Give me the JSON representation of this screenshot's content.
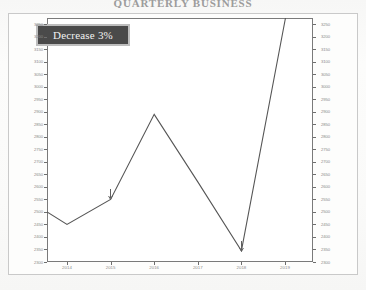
{
  "title": "QUARTERLY BUSINESS",
  "callout": {
    "label": "Decrease 3%",
    "box_color": "#4a4a4a",
    "border_color": "#bdbdbd",
    "text_color": "#f2f2f2"
  },
  "axis": {
    "y_left_ticks": [
      "3250",
      "3200",
      "3150",
      "3100",
      "3050",
      "3000",
      "2950",
      "2900",
      "2850",
      "2800",
      "2750",
      "2700",
      "2650",
      "2600",
      "2550",
      "2500",
      "2450",
      "2400",
      "2350",
      "2300"
    ],
    "y_right_ticks": [
      "3250",
      "3200",
      "3150",
      "3100",
      "3050",
      "3000",
      "2950",
      "2900",
      "2850",
      "2800",
      "2750",
      "2700",
      "2650",
      "2600",
      "2550",
      "2500",
      "2450",
      "2400",
      "2350",
      "2300"
    ],
    "x_ticks": [
      "2014",
      "2015",
      "2016",
      "2017",
      "2018",
      "2019"
    ]
  },
  "annotations": [
    {
      "name": "arrow-2015",
      "symbol": "down-arrow"
    },
    {
      "name": "arrow-2018",
      "symbol": "down-arrow"
    }
  ],
  "chart_data": {
    "type": "line",
    "title": "QUARTERLY BUSINESS",
    "xlabel": "",
    "ylabel": "",
    "categories": [
      "2014",
      "2015",
      "2016",
      "2017",
      "2018",
      "2019"
    ],
    "x": [
      2014,
      2015,
      2016,
      2017,
      2018,
      2019
    ],
    "values": [
      2450,
      2550,
      2890,
      2620,
      2345,
      3265
    ],
    "series": [
      {
        "name": "Value",
        "values": [
          2450,
          2550,
          2890,
          2620,
          2345,
          3265
        ],
        "color": "#555555"
      }
    ],
    "start_edge_value": 2500,
    "ylim": [
      2300,
      3275
    ],
    "ytick_step": 50,
    "grid": false,
    "legend": "none",
    "line_color": "#555555",
    "markers": false,
    "annotations": [
      {
        "x": "2015",
        "y": 2550,
        "type": "down-arrow"
      },
      {
        "x": "2018",
        "y": 2345,
        "type": "down-arrow"
      },
      {
        "text": "Decrease 3%",
        "type": "textbox"
      }
    ]
  }
}
